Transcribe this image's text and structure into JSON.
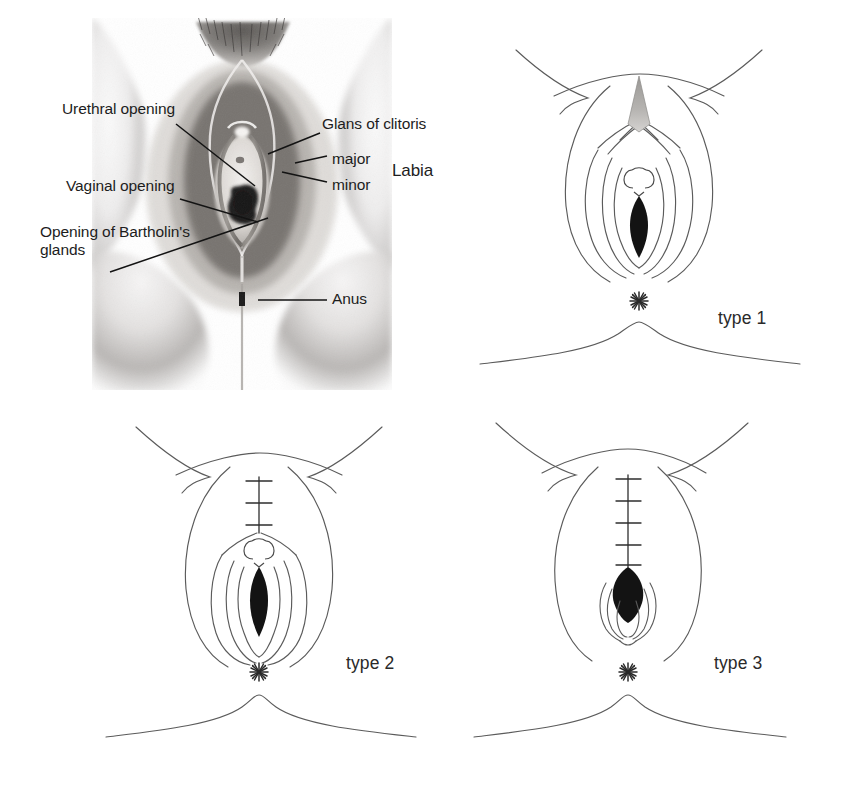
{
  "figure": {
    "background_color": "#ffffff",
    "ink_color": "#1d1d1d",
    "line_color": "#555555"
  },
  "anatomy_panel": {
    "name": "labelled anatomical photograph",
    "labels": [
      {
        "id": "urethral-opening",
        "text": "Urethral opening",
        "x": 62,
        "y": 108,
        "align": "left"
      },
      {
        "id": "vaginal-opening",
        "text": "Vaginal opening",
        "x": 66,
        "y": 185,
        "align": "left"
      },
      {
        "id": "bartholin-glands",
        "text": "Opening of Bartholin's\nglands",
        "x": 40,
        "y": 231,
        "align": "left"
      },
      {
        "id": "glans-of-clitoris",
        "text": "Glans of clitoris",
        "x": 322,
        "y": 123,
        "align": "left"
      },
      {
        "id": "labia-major",
        "text": "major",
        "x": 330,
        "y": 160,
        "align": "left"
      },
      {
        "id": "labia-minor",
        "text": "minor",
        "x": 330,
        "y": 186,
        "align": "left"
      },
      {
        "id": "labia-brace",
        "text": "Labia",
        "x": 390,
        "y": 170,
        "align": "left"
      },
      {
        "id": "anus",
        "text": "Anus",
        "x": 330,
        "y": 298,
        "align": "left"
      }
    ],
    "leader_lines": [
      {
        "id": "leader-urethral-opening",
        "x1": 176,
        "y1": 124,
        "x2": 255,
        "y2": 186
      },
      {
        "id": "leader-vaginal-opening",
        "x1": 180,
        "y1": 199,
        "x2": 258,
        "y2": 222
      },
      {
        "id": "leader-bartholin-glands",
        "x1": 110,
        "y1": 272,
        "x2": 268,
        "y2": 218
      },
      {
        "id": "leader-glans-of-clitoris",
        "x1": 320,
        "y1": 133,
        "x2": 268,
        "y2": 154
      },
      {
        "id": "leader-labia-major",
        "x1": 327,
        "y1": 156,
        "x2": 295,
        "y2": 163
      },
      {
        "id": "leader-labia-minor",
        "x1": 327,
        "y1": 182,
        "x2": 282,
        "y2": 172
      },
      {
        "id": "leader-anus",
        "x1": 327,
        "y1": 300,
        "x2": 258,
        "y2": 300
      }
    ]
  },
  "type_panels": [
    {
      "id": "type-1",
      "caption": "type 1",
      "caption_x": 256,
      "caption_y": 298,
      "description": "clitoridectomy - glans of clitoris removed, introitus open",
      "sutures": 0,
      "suture_line": false,
      "introitus": "open",
      "urethral_circle": true,
      "pubic_triangle": true
    },
    {
      "id": "type-2",
      "caption": "type 2",
      "caption_x": 240,
      "caption_y": 248,
      "description": "excision - clitoris and labia minora removed, partial closure with three sutures",
      "sutures": 3,
      "suture_line": true,
      "introitus": "open",
      "urethral_circle": true,
      "pubic_triangle": false
    },
    {
      "id": "type-3",
      "caption": "type 3",
      "caption_x": 240,
      "caption_y": 248,
      "description": "infibulation - narrowed vaginal opening sealed with five sutures",
      "sutures": 5,
      "suture_line": true,
      "introitus": "narrowed",
      "urethral_circle": false,
      "pubic_triangle": false
    }
  ],
  "markers": {
    "anus_marker": "starburst",
    "anus_marker_spokes": 11
  }
}
